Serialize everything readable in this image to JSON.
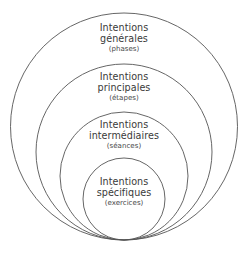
{
  "diagram": {
    "type": "nested-circles-venn",
    "background_color": "#ffffff",
    "stroke_color": "#555555",
    "text_color": "#3a3a3a",
    "levels": [
      {
        "id": "generales",
        "title_line1": "Intentions",
        "title_line2": "générales",
        "subtitle": "(phases)",
        "order": 1
      },
      {
        "id": "principales",
        "title_line1": "Intentions",
        "title_line2": "principales",
        "subtitle": "(étapes)",
        "order": 2
      },
      {
        "id": "intermediaires",
        "title_line1": "Intentions",
        "title_line2": "intermédiaires",
        "subtitle": "(séances)",
        "order": 3
      },
      {
        "id": "specifiques",
        "title_line1": "Intentions",
        "title_line2": "spécifiques",
        "subtitle": "(exercices)",
        "order": 4
      }
    ]
  },
  "chart_data": {
    "type": "venn",
    "title": "",
    "xlabel": "",
    "ylabel": "",
    "legend_position": "none",
    "grid": false,
    "categories": [
      "Intentions générales (phases)",
      "Intentions principales (étapes)",
      "Intentions intermédiaires (séances)",
      "Intentions spécifiques (exercices)"
    ],
    "values": [
      227,
      176,
      128,
      82
    ],
    "value_unit": "circle diameter in px",
    "circles": [
      {
        "label": "Intentions générales (phases)",
        "cx": 124,
        "cy": 126.5,
        "r": 113.5
      },
      {
        "label": "Intentions principales (étapes)",
        "cx": 124,
        "cy": 152.0,
        "r": 88.0
      },
      {
        "label": "Intentions intermédiaires (séances)",
        "cx": 124,
        "cy": 176.0,
        "r": 64.0
      },
      {
        "label": "Intentions spécifiques (exercices)",
        "cx": 124,
        "cy": 199.0,
        "r": 41.0
      }
    ]
  }
}
